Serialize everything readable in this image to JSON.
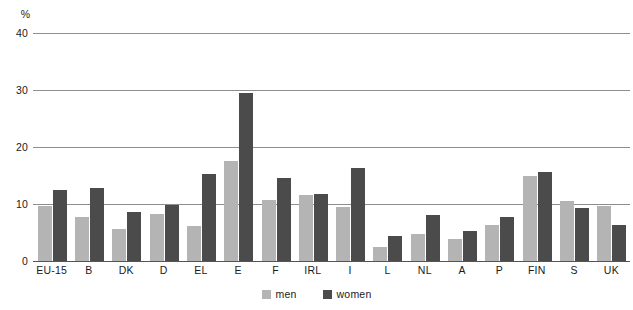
{
  "chart_data": {
    "type": "bar",
    "title": "",
    "subtitle": "",
    "xlabel": "",
    "ylabel": "%",
    "unit_label": "%",
    "ylim": [
      0,
      40
    ],
    "yticks": [
      0,
      10,
      20,
      30,
      40
    ],
    "ytick_labels": [
      "0",
      "10",
      "20",
      "30",
      "40"
    ],
    "grid": true,
    "grid_axis": "y",
    "legend_position": "bottom-center",
    "categories": [
      "EU-15",
      "B",
      "DK",
      "D",
      "EL",
      "E",
      "F",
      "IRL",
      "I",
      "L",
      "NL",
      "A",
      "P",
      "FIN",
      "S",
      "UK"
    ],
    "series": [
      {
        "name": "men",
        "color": "#b4b4b4",
        "values": [
          9.6,
          7.7,
          5.6,
          8.2,
          6.2,
          17.5,
          10.7,
          11.5,
          9.4,
          2.5,
          4.8,
          3.8,
          6.4,
          15.0,
          10.5,
          9.6
        ]
      },
      {
        "name": "women",
        "color": "#4b4b4b",
        "values": [
          12.4,
          12.8,
          8.6,
          9.8,
          15.2,
          29.5,
          14.5,
          11.8,
          16.3,
          4.4,
          8.1,
          5.3,
          7.7,
          15.7,
          9.3,
          6.4
        ]
      }
    ]
  },
  "legend": {
    "entries": [
      {
        "label": "men",
        "color": "#b4b4b4"
      },
      {
        "label": "women",
        "color": "#4b4b4b"
      }
    ]
  },
  "colors": {
    "men": "#b4b4b4",
    "women": "#4b4b4b",
    "gridline": "#8e8e8e",
    "text": "#1a1a1a",
    "background": "#ffffff"
  }
}
